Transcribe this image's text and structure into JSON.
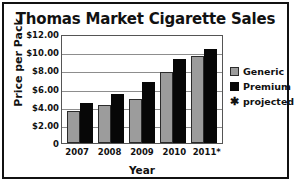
{
  "chart_data": {
    "type": "bar",
    "title": "Thomas Market Cigarette Sales",
    "xlabel": "Year",
    "ylabel": "Price per Pack",
    "categories": [
      "2007",
      "2008",
      "2009",
      "2010",
      "2011*"
    ],
    "series": [
      {
        "name": "Generic",
        "color": "#9c9c9c",
        "values": [
          3.5,
          4.15,
          4.85,
          7.85,
          9.55
        ]
      },
      {
        "name": "Premium",
        "color": "#070707",
        "values": [
          4.4,
          5.4,
          6.75,
          9.3,
          10.4
        ]
      }
    ],
    "ylim": [
      0,
      12
    ],
    "yticks": [
      "0",
      "$2.00",
      "$4.00",
      "$6.00",
      "$8.00",
      "$10.00",
      "$12.00"
    ],
    "ytick_values": [
      0,
      2,
      4,
      6,
      8,
      10,
      12
    ],
    "grid": true,
    "legend_position": "right",
    "annotations": [
      "* projected"
    ]
  },
  "legend": {
    "items": [
      {
        "label": "Generic",
        "kind": "generic"
      },
      {
        "label": "Premium",
        "kind": "premium"
      },
      {
        "label": "projected",
        "kind": "star",
        "glyph": "✱"
      }
    ]
  }
}
